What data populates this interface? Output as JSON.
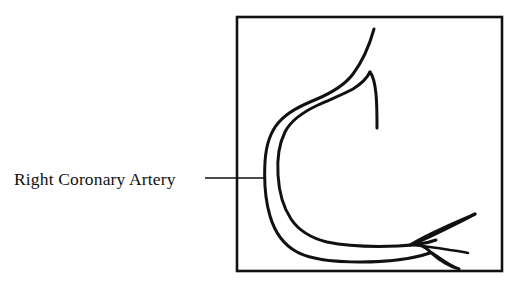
{
  "figure": {
    "kind": "anatomical-line-diagram",
    "subject": "Right Coronary Artery",
    "background_color": "#ffffff",
    "ink_color": "#111111",
    "label": {
      "text": "Right Coronary Artery",
      "x": 14,
      "y": 185,
      "font_size_px": 17.5
    },
    "leader_line": {
      "name": "leader-line",
      "from_x": 205,
      "from_y": 178,
      "to_x": 264,
      "to_y": 178,
      "stroke_width": 1.4
    },
    "frame": {
      "name": "diagram-frame",
      "x": 237,
      "y": 17,
      "width": 265,
      "height": 254,
      "stroke_width": 2.6,
      "fill": "none"
    },
    "vessel": {
      "name": "right-coronary-artery-vessel",
      "stroke_width": 3.0,
      "outer_wall_path": "M 374 29 C 369 47 362 62 353 74 C 344 86 331 93 317 99 C 300 106 288 112 279 122 C 270 132 266 145 265 162 C 264 180 265 199 270 216 C 275 233 284 245 297 252 C 312 260 334 262 360 262 C 386 262 412 259 430 253",
      "inner_wall_path": "M 370 72 C 367 78 361 84 353 89 C 344 94 331 99 318 105 C 303 112 291 120 285 132 C 279 144 277 159 278 175 C 279 192 283 207 291 219 C 299 231 311 238 327 242 C 346 246 372 247 398 246 C 416 245 428 243 436 240",
      "superior_branch_path": "M 377 128 C 377 116 377 104 376 94 C 375 84 374 77 370 72",
      "fork_branches": [
        {
          "name": "fork-upper-prong",
          "path": "M 416 243 C 430 237 444 230 456 224 C 464 220 470 217 475 214"
        },
        {
          "name": "fork-upper-prong-return",
          "path": "M 475 214 C 468 217 456 222 443 228 C 430 234 418 240 410 245"
        },
        {
          "name": "fork-middle-prong",
          "path": "M 412 245 C 424 246 438 248 450 250 C 458 251 464 252 468 253"
        },
        {
          "name": "fork-lower-prong",
          "path": "M 425 247 C 431 253 438 259 445 263 C 450 266 455 268 459 269"
        },
        {
          "name": "fork-lower-prong-return",
          "path": "M 459 269 C 452 266 444 261 437 256 C 430 251 424 247 419 245"
        }
      ]
    }
  }
}
